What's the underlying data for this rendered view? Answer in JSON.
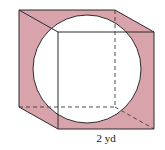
{
  "figure": {
    "edge_label": "2 yd",
    "colors": {
      "cube_fill": "#d9a3ab",
      "edge": "#2b2b2b",
      "sphere_fill": "#ffffff"
    }
  }
}
